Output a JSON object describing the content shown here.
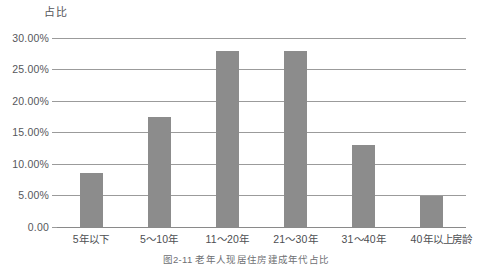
{
  "chart_data": {
    "type": "bar",
    "title": "",
    "subtitle": "",
    "ylabel": "占比",
    "xlabel": "房龄",
    "categories": [
      "5年以下",
      "5～10年",
      "11～20年",
      "21～30年",
      "31～40年",
      "40年以上"
    ],
    "values": [
      8.5,
      17.5,
      28.0,
      28.0,
      13.0,
      5.0
    ],
    "value_unit": "%",
    "ylim": [
      0,
      30
    ],
    "ytick_values": [
      30,
      25,
      20,
      15,
      10,
      5,
      0
    ],
    "ytick_labels": [
      "30.00%",
      "25.00%",
      "20.00%",
      "15.00%",
      "10.00%",
      "5.00%",
      "0.00"
    ],
    "grid": true,
    "grid_axis": "y",
    "legend": false,
    "legend_position": "none",
    "series": [
      {
        "name": "占比",
        "color": "#8c8c8c",
        "values": [
          8.5,
          17.5,
          28.0,
          28.0,
          13.0,
          5.0
        ]
      }
    ]
  },
  "colors": {
    "bar": "#8c8c8c",
    "gridline": "#9b9b9b",
    "axis": "#8a8a8a",
    "text": "#4d4e52",
    "background": "#ffffff"
  },
  "caption": {
    "text": "图2-11  老年人现居住房建成年代占比"
  }
}
